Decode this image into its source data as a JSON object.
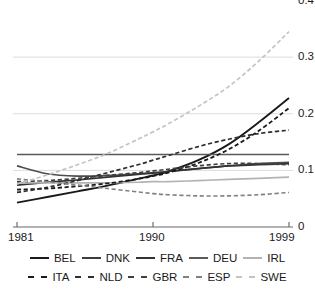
{
  "chart_data": {
    "type": "line",
    "title": "",
    "xlabel": "",
    "ylabel": "",
    "xlim": [
      1981,
      1999
    ],
    "ylim": [
      0,
      0.4
    ],
    "grid": true,
    "grid_axis": "y",
    "legend_position": "bottom",
    "x_ticks": [
      "1981",
      "1990",
      "1999"
    ],
    "x_tick_values": [
      1981,
      1990,
      1999
    ],
    "y_ticks": [
      "0",
      "0.1",
      "0.2",
      "0.3",
      "0.4"
    ],
    "y_tick_values": [
      0,
      0.1,
      0.2,
      0.3,
      0.4
    ],
    "x": [
      1981,
      1983,
      1985,
      1987,
      1989,
      1990,
      1991,
      1993,
      1995,
      1997,
      1999
    ],
    "series": [
      {
        "name": "BEL",
        "style": "solid",
        "color": "#1a1a1a",
        "width": 1.9,
        "values": [
          0.043,
          0.053,
          0.063,
          0.073,
          0.085,
          0.091,
          0.098,
          0.118,
          0.146,
          0.185,
          0.228
        ]
      },
      {
        "name": "DNK",
        "style": "solid",
        "color": "#4d4d4d",
        "width": 1.7,
        "values": [
          0.108,
          0.094,
          0.09,
          0.091,
          0.094,
          0.096,
          0.098,
          0.103,
          0.108,
          0.112,
          0.114
        ]
      },
      {
        "name": "FRA",
        "style": "solid",
        "color": "#333333",
        "width": 1.7,
        "values": [
          0.074,
          0.079,
          0.083,
          0.088,
          0.093,
          0.095,
          0.098,
          0.103,
          0.108,
          0.11,
          0.112
        ]
      },
      {
        "name": "DEU",
        "style": "solid",
        "color": "#5a5a5a",
        "width": 1.7,
        "values": [
          0.128,
          0.128,
          0.128,
          0.128,
          0.128,
          0.128,
          0.128,
          0.128,
          0.128,
          0.128,
          0.128
        ]
      },
      {
        "name": "IRL",
        "style": "solid",
        "color": "#b3b3b3",
        "width": 1.7,
        "values": [
          0.078,
          0.078,
          0.078,
          0.078,
          0.079,
          0.08,
          0.08,
          0.082,
          0.084,
          0.086,
          0.088
        ]
      },
      {
        "name": "ITA",
        "style": "dashed",
        "color": "#1a1a1a",
        "width": 1.8,
        "values": [
          0.066,
          0.068,
          0.072,
          0.077,
          0.085,
          0.09,
          0.096,
          0.113,
          0.137,
          0.17,
          0.21
        ]
      },
      {
        "name": "NLD",
        "style": "dashed",
        "color": "#2e2e2e",
        "width": 1.7,
        "values": [
          0.061,
          0.07,
          0.082,
          0.096,
          0.11,
          0.118,
          0.126,
          0.142,
          0.155,
          0.165,
          0.171
        ]
      },
      {
        "name": "GBR",
        "style": "dashed",
        "color": "#404040",
        "width": 1.7,
        "values": [
          0.08,
          0.082,
          0.086,
          0.091,
          0.096,
          0.099,
          0.102,
          0.108,
          0.112,
          0.112,
          0.11
        ]
      },
      {
        "name": "ESP",
        "style": "dashed",
        "color": "#808080",
        "width": 1.6,
        "values": [
          0.085,
          0.08,
          0.074,
          0.068,
          0.062,
          0.059,
          0.057,
          0.055,
          0.055,
          0.057,
          0.061
        ]
      },
      {
        "name": "SWE",
        "style": "dashed",
        "color": "#c4c4c4",
        "width": 1.7,
        "values": [
          0.076,
          0.092,
          0.11,
          0.13,
          0.155,
          0.168,
          0.182,
          0.213,
          0.248,
          0.293,
          0.345
        ]
      }
    ],
    "legend_rows": [
      [
        {
          "label": "BEL",
          "style": "solid",
          "color": "#1a1a1a"
        },
        {
          "label": "DNK",
          "style": "solid",
          "color": "#3d3d3d"
        },
        {
          "label": "FRA",
          "style": "solid",
          "color": "#333333"
        },
        {
          "label": "DEU",
          "style": "solid",
          "color": "#5a5a5a"
        },
        {
          "label": "IRL",
          "style": "solid",
          "color": "#b3b3b3"
        }
      ],
      [
        {
          "label": "ITA",
          "style": "dashed",
          "color": "#1a1a1a"
        },
        {
          "label": "NLD",
          "style": "dashed",
          "color": "#2e2e2e"
        },
        {
          "label": "GBR",
          "style": "dashed",
          "color": "#404040"
        },
        {
          "label": "ESP",
          "style": "dashed",
          "color": "#808080"
        },
        {
          "label": "SWE",
          "style": "dashed",
          "color": "#c4c4c4"
        }
      ]
    ]
  }
}
